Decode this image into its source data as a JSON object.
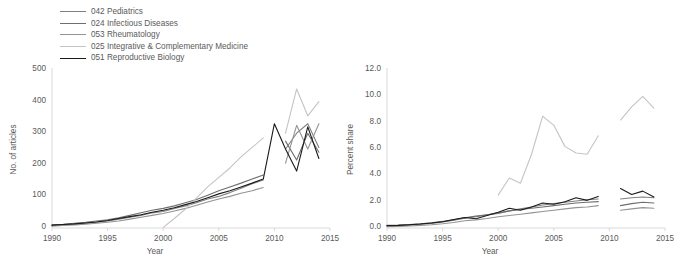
{
  "legend": {
    "items": [
      {
        "label": "042 Pediatrics",
        "color": "#808080"
      },
      {
        "label": "024 Infectious Diseases",
        "color": "#6e6e6e"
      },
      {
        "label": "053 Rheumatology",
        "color": "#949494"
      },
      {
        "label": "025 Integrative & Complementary Medicine",
        "color": "#c4c4c4"
      },
      {
        "label": "051 Reproductive Biology",
        "color": "#1a1a1a"
      }
    ]
  },
  "chart_data": [
    {
      "type": "line",
      "title": "",
      "xlabel": "Year",
      "ylabel": "No. of articles",
      "xlim": [
        1990,
        2015
      ],
      "ylim": [
        0,
        500
      ],
      "xticks": [
        1990,
        1995,
        2000,
        2005,
        2010,
        2015
      ],
      "yticks": [
        0,
        100,
        200,
        300,
        400,
        500
      ],
      "grid": false,
      "legend_position": "top-left-outside",
      "x": [
        1990,
        1991,
        1992,
        1993,
        1994,
        1995,
        1996,
        1997,
        1998,
        1999,
        2000,
        2001,
        2002,
        2003,
        2004,
        2005,
        2006,
        2007,
        2008,
        2009,
        2010,
        2011,
        2012,
        2013,
        2014
      ],
      "series": [
        {
          "name": "042 Pediatrics",
          "color": "#808080",
          "values": [
            8,
            10,
            12,
            15,
            18,
            22,
            28,
            34,
            40,
            48,
            52,
            62,
            70,
            80,
            92,
            100,
            112,
            126,
            140,
            152,
            null,
            250,
            300,
            330,
            255
          ]
        },
        {
          "name": "024 Infectious Diseases",
          "color": "#6e6e6e",
          "values": [
            10,
            12,
            15,
            18,
            22,
            26,
            32,
            40,
            48,
            56,
            62,
            70,
            80,
            90,
            104,
            118,
            130,
            142,
            155,
            168,
            null,
            275,
            215,
            300,
            240
          ]
        },
        {
          "name": "053 Rheumatology",
          "color": "#949494",
          "values": [
            6,
            8,
            10,
            12,
            15,
            18,
            22,
            28,
            34,
            40,
            46,
            54,
            62,
            72,
            82,
            92,
            100,
            110,
            118,
            128,
            null,
            205,
            325,
            250,
            330
          ]
        },
        {
          "name": "025 Integrative & Complementary Medicine",
          "color": "#c4c4c4",
          "values": [
            null,
            null,
            null,
            null,
            null,
            null,
            null,
            null,
            null,
            null,
            2,
            30,
            60,
            95,
            130,
            160,
            190,
            225,
            255,
            285,
            null,
            300,
            440,
            355,
            400
          ]
        },
        {
          "name": "051 Reproductive Biology",
          "color": "#1a1a1a",
          "values": [
            9,
            11,
            13,
            16,
            19,
            24,
            30,
            36,
            42,
            50,
            56,
            64,
            74,
            84,
            96,
            108,
            118,
            130,
            142,
            155,
            330,
            250,
            180,
            320,
            220
          ]
        }
      ]
    },
    {
      "type": "line",
      "title": "",
      "xlabel": "Year",
      "ylabel": "Percent share",
      "xlim": [
        1990,
        2015
      ],
      "ylim": [
        0.0,
        12.0
      ],
      "xticks": [
        1990,
        1995,
        2000,
        2005,
        2010,
        2015
      ],
      "yticks": [
        "0.0",
        "2.0",
        "4.0",
        "6.0",
        "8.0",
        "10.0",
        "12.0"
      ],
      "grid": false,
      "legend_position": "shared",
      "x": [
        1990,
        1991,
        1992,
        1993,
        1994,
        1995,
        1996,
        1997,
        1998,
        1999,
        2000,
        2001,
        2002,
        2003,
        2004,
        2005,
        2006,
        2007,
        2008,
        2009,
        2010,
        2011,
        2012,
        2013,
        2014
      ],
      "series": [
        {
          "name": "042 Pediatrics",
          "color": "#808080",
          "values": [
            0.15,
            0.18,
            0.22,
            0.28,
            0.35,
            0.45,
            0.6,
            0.75,
            0.85,
            1.0,
            1.1,
            1.3,
            1.45,
            1.6,
            1.75,
            1.85,
            1.95,
            2.05,
            2.15,
            2.2,
            null,
            2.2,
            2.3,
            2.35,
            2.3
          ]
        },
        {
          "name": "024 Infectious Diseases",
          "color": "#6e6e6e",
          "values": [
            0.2,
            0.22,
            0.26,
            0.32,
            0.4,
            0.5,
            0.62,
            0.78,
            0.9,
            1.0,
            1.15,
            1.3,
            1.4,
            1.5,
            1.6,
            1.7,
            1.8,
            1.9,
            1.95,
            2.0,
            null,
            1.7,
            1.85,
            1.95,
            1.9
          ]
        },
        {
          "name": "053 Rheumatology",
          "color": "#949494",
          "values": [
            0.1,
            0.12,
            0.15,
            0.2,
            0.25,
            0.32,
            0.42,
            0.55,
            0.62,
            0.72,
            0.85,
            0.95,
            1.05,
            1.15,
            1.25,
            1.35,
            1.45,
            1.55,
            1.6,
            1.7,
            null,
            1.35,
            1.45,
            1.55,
            1.5
          ]
        },
        {
          "name": "025 Integrative & Complementary Medicine",
          "color": "#c4c4c4",
          "values": [
            null,
            null,
            null,
            null,
            null,
            null,
            null,
            null,
            null,
            null,
            2.5,
            3.8,
            3.4,
            5.6,
            8.5,
            7.8,
            6.2,
            5.7,
            5.6,
            7.0,
            null,
            8.2,
            9.2,
            10.0,
            9.1
          ]
        },
        {
          "name": "051 Reproductive Biology",
          "color": "#1a1a1a",
          "values": [
            0.18,
            0.2,
            0.25,
            0.3,
            0.38,
            0.48,
            0.65,
            0.8,
            0.7,
            0.95,
            1.2,
            1.5,
            1.35,
            1.6,
            1.9,
            1.8,
            2.0,
            2.3,
            2.1,
            2.4,
            null,
            3.0,
            2.55,
            2.8,
            2.35
          ]
        }
      ]
    }
  ]
}
